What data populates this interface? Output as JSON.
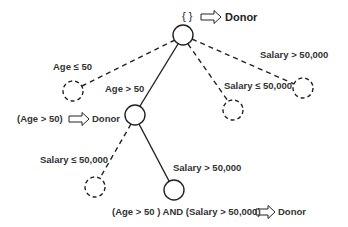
{
  "diagram": {
    "type": "decision-tree",
    "nodes": [
      {
        "id": "root",
        "x": 183,
        "y": 35,
        "style": "solid",
        "annotation": "{ }",
        "result": "Donor"
      },
      {
        "id": "age_le_50",
        "x": 73,
        "y": 91,
        "style": "dashed"
      },
      {
        "id": "age_gt_50",
        "x": 135,
        "y": 115,
        "style": "solid",
        "annotation": "(Age  > 50)",
        "result": "Donor"
      },
      {
        "id": "root_sal_le",
        "x": 233,
        "y": 110,
        "style": "dashed"
      },
      {
        "id": "root_sal_gt",
        "x": 303,
        "y": 88,
        "style": "dashed"
      },
      {
        "id": "age_sal_le",
        "x": 95,
        "y": 187,
        "style": "dashed"
      },
      {
        "id": "age_sal_gt",
        "x": 174,
        "y": 190,
        "style": "solid",
        "annotation": "(Age > 50 ) AND (Salary > 50,000)",
        "result": "Donor"
      }
    ],
    "edges": [
      {
        "from": "root",
        "to": "age_le_50",
        "label": "Age  ≤  50",
        "style": "dashed"
      },
      {
        "from": "root",
        "to": "age_gt_50",
        "label": "Age  > 50",
        "style": "solid"
      },
      {
        "from": "root",
        "to": "root_sal_le",
        "label": "Salary ≤ 50,000",
        "style": "dashed"
      },
      {
        "from": "root",
        "to": "root_sal_gt",
        "label": "Salary > 50,000",
        "style": "dashed"
      },
      {
        "from": "age_gt_50",
        "to": "age_sal_le",
        "label": "Salary ≤ 50,000",
        "style": "dashed"
      },
      {
        "from": "age_gt_50",
        "to": "age_sal_gt",
        "label": "Salary > 50,000",
        "style": "solid"
      }
    ]
  },
  "labels": {
    "root_set": "{ }",
    "root_result": "Donor",
    "age_le_50": "Age  ≤  50",
    "age_gt_50": "Age  > 50",
    "root_salary_gt": "Salary > 50,000",
    "root_salary_le": "Salary ≤ 50,000",
    "node2_rule": "(Age  > 50)",
    "node2_result": "Donor",
    "node2_salary_le": "Salary ≤ 50,000",
    "node2_salary_gt": "Salary > 50,000",
    "leaf_rule": "(Age > 50 ) AND (Salary > 50,000)",
    "leaf_result": "Donor"
  },
  "icons": {
    "implies": "double-arrow-right-icon"
  },
  "colors": {
    "line": "#222222",
    "text": "#333333"
  }
}
